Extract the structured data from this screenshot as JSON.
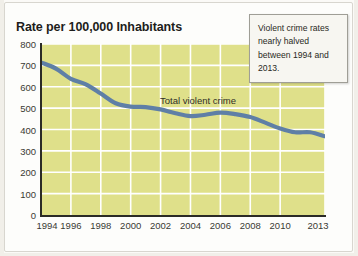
{
  "chart_data": {
    "type": "line",
    "title": "Rate per 100,000 Inhabitants",
    "xlabel": "",
    "ylabel": "",
    "ylim": [
      0,
      800
    ],
    "ytick_step": 100,
    "yticks": [
      "800",
      "700",
      "600",
      "500",
      "400",
      "300",
      "200",
      "100",
      "0"
    ],
    "xticks": [
      "1994",
      "1996",
      "1998",
      "2000",
      "2002",
      "2004",
      "2006",
      "2008",
      "2010",
      "2013"
    ],
    "xlim": [
      1994,
      2013
    ],
    "grid": true,
    "grid_color": "#ffffff",
    "plot_background": "#dfe08a",
    "legend_position": "inline",
    "series": [
      {
        "name": "Total violent crime",
        "color": "#5f7fa6",
        "x": [
          1994,
          1995,
          1996,
          1997,
          1998,
          1999,
          2000,
          2001,
          2002,
          2003,
          2004,
          2005,
          2006,
          2007,
          2008,
          2009,
          2010,
          2011,
          2012,
          2013
        ],
        "values": [
          714,
          685,
          637,
          611,
          568,
          523,
          507,
          505,
          494,
          476,
          463,
          469,
          479,
          472,
          458,
          432,
          405,
          387,
          387,
          368
        ]
      }
    ],
    "annotations": [
      {
        "name": "callout",
        "text": "Violent crime rates nearly halved between 1994 and 2013."
      }
    ]
  },
  "series_label": "Total violent crime"
}
